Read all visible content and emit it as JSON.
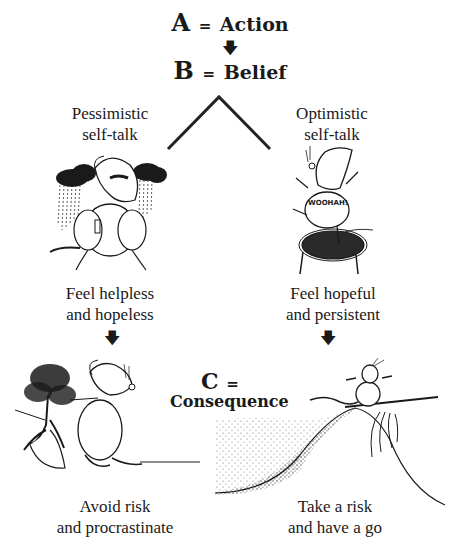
{
  "header": {
    "a_letter": "A",
    "a_equals": "=",
    "a_word": "Action",
    "b_letter": "B",
    "b_equals": "=",
    "b_word": "Belief",
    "down_arrow": "🡇"
  },
  "branches": {
    "left": {
      "selftalk_line1": "Pessimistic",
      "selftalk_line2": "self-talk",
      "illustration": "rain-cloud-mouse-icon",
      "feeling_line1": "Feel helpless",
      "feeling_line2": "and hopeless",
      "arrow": "🡇",
      "outcome_line1": "Avoid risk",
      "outcome_line2": "and procrastinate",
      "outcome_illustration": "mouse-hiding-behind-tree-icon"
    },
    "right": {
      "selftalk_line1": "Optimistic",
      "selftalk_line2": "self-talk",
      "illustration": "trampoline-mouse-icon",
      "shirt_text": "WOOHAH!",
      "feeling_line1": "Feel hopeful",
      "feeling_line2": "and persistent",
      "arrow": "🡇",
      "outcome_line1": "Take a risk",
      "outcome_line2": "and have a go",
      "outcome_illustration": "mouse-surfing-wave-icon"
    }
  },
  "consequence": {
    "letter": "C",
    "equals": "=",
    "word": "Consequence"
  },
  "colors": {
    "ink": "#1a1a1a",
    "background": "#ffffff"
  }
}
